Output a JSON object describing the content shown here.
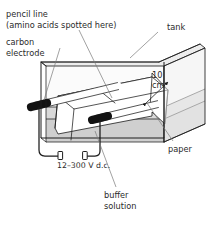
{
  "figure": {
    "background_color": "#ffffff",
    "line_color": "#1c1c1c",
    "leader_color": "#7a7a7a",
    "text_color": "#2b2b2b"
  },
  "labels": {
    "pencil_line": "pencil line",
    "pencil_line_sub": "(amino acids spotted here)",
    "carbon_electrode_1": "carbon",
    "carbon_electrode_2": "electrode",
    "tank": "tank",
    "dimension_value": "10",
    "dimension_unit": "cm",
    "power_supply": "12–300 V d.c.",
    "paper": "paper",
    "buffer_1": "buffer",
    "buffer_2": "solution"
  },
  "colors": {
    "buffer_solution": "#d9d9d9",
    "buffer_solution_front": "#cfcfcf",
    "tank_wall_tint": "#f2f2f2",
    "tank_lid_tint": "#ededed",
    "electrode_body": "#ffffff",
    "electrode_tip": "#121212",
    "paper_strip": "#ffffff"
  },
  "components": [
    {
      "name": "tank",
      "description": "transparent rectangular 3D box container"
    },
    {
      "name": "buffer-solution",
      "description": "shaded liquid filling lower portion of tank"
    },
    {
      "name": "paper-strip",
      "description": "chromatography paper draped over electrodes, ends dipping in buffer"
    },
    {
      "name": "carbon-electrode-left",
      "description": "cylindrical carbon rod with dark tip"
    },
    {
      "name": "carbon-electrode-right",
      "description": "cylindrical carbon rod with dark tip"
    },
    {
      "name": "power-supply-circuit",
      "description": "wire loop with two terminal connectors"
    },
    {
      "name": "dimension-marker",
      "description": "10 cm double arrow across paper width"
    },
    {
      "name": "pencil-line",
      "description": "marked origin line on paper where amino acids are spotted"
    }
  ]
}
